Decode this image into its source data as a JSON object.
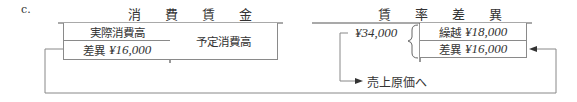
{
  "item_label": "c.",
  "left_account": {
    "title": "消 費 賃 金",
    "debit_rows": [
      {
        "label": "実際消費高",
        "amount": ""
      },
      {
        "label": "差異",
        "amount": "¥16,000"
      }
    ],
    "credit_rows": [
      {
        "label": "予定消費高"
      }
    ]
  },
  "right_account": {
    "title": "賃 率 差 異",
    "debit_total": "¥34,000",
    "credit_rows": [
      {
        "label": "繰越",
        "amount": "¥18,000"
      },
      {
        "label": "差異",
        "amount": "¥16,000"
      }
    ]
  },
  "arrow_label": "売上原価へ",
  "colors": {
    "line": "#6e6e6e",
    "text": "#333333"
  }
}
